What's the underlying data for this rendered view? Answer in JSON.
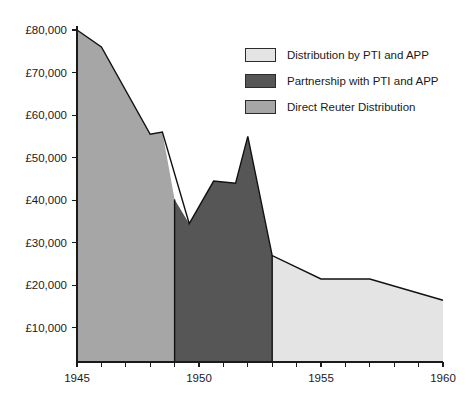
{
  "chart_data": {
    "type": "area",
    "title": "",
    "xlabel": "",
    "ylabel": "",
    "xlim": [
      1945,
      1960
    ],
    "ylim": [
      0,
      80000
    ],
    "grid": false,
    "legend_position": "top-right",
    "x_ticks": [
      1945,
      1946,
      1947,
      1948,
      1949,
      1950,
      1951,
      1952,
      1953,
      1954,
      1955,
      1956,
      1957,
      1958,
      1959,
      1960
    ],
    "x_tick_labels": [
      "1945",
      "",
      "",
      "",
      "",
      "1950",
      "",
      "",
      "",
      "",
      "1955",
      "",
      "",
      "",
      "",
      "1960"
    ],
    "y_ticks": [
      10000,
      20000,
      30000,
      40000,
      50000,
      60000,
      70000,
      80000
    ],
    "y_tick_labels": [
      "£10,000",
      "£20,000",
      "£30,000",
      "£40,000",
      "£50,000",
      "£60,000",
      "£70,000",
      "£80,000"
    ],
    "x": [
      1945,
      1946,
      1948,
      1948.5,
      1949.6,
      1950.6,
      1951.5,
      1952,
      1953,
      1955,
      1957,
      1960
    ],
    "values": [
      80000,
      76000,
      55500,
      56000,
      34500,
      44500,
      44000,
      55000,
      27000,
      21500,
      21500,
      16500
    ],
    "series": [
      {
        "name": "Direct Reuter Distribution",
        "color": "#a6a6a6",
        "x_start": 1945,
        "x_end": 1949,
        "x": [
          1945,
          1946,
          1948,
          1948.5,
          1949
        ],
        "values": [
          80000,
          76000,
          55500,
          56000,
          40200
        ]
      },
      {
        "name": "Partnership with PTI and APP",
        "color": "#565656",
        "x_start": 1949,
        "x_end": 1953,
        "x": [
          1949,
          1949.6,
          1950.6,
          1951.5,
          1952,
          1953
        ],
        "values": [
          40200,
          34500,
          44500,
          44000,
          55000,
          27000
        ]
      },
      {
        "name": "Distribution by PTI and APP",
        "color": "#e4e4e4",
        "x_start": 1953,
        "x_end": 1960,
        "x": [
          1953,
          1955,
          1957,
          1960
        ],
        "values": [
          27000,
          21500,
          21500,
          16500
        ]
      }
    ]
  },
  "legend": {
    "items": [
      {
        "label": "Distribution by PTI and APP",
        "color": "#e4e4e4"
      },
      {
        "label": "Partnership with PTI and APP",
        "color": "#565656"
      },
      {
        "label": "Direct Reuter Distribution",
        "color": "#a6a6a6"
      }
    ]
  },
  "colors": {
    "axis": "#1a1a1a",
    "outline": "#111111",
    "background": "#ffffff"
  }
}
